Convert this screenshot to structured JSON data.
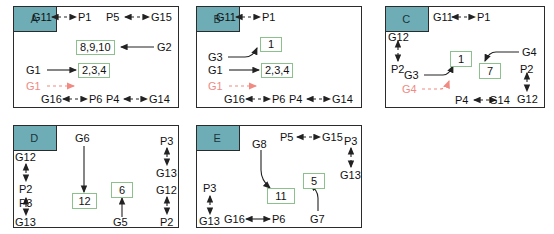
{
  "figure": {
    "title": "",
    "panel_label_color": "#6fadb6",
    "box_border_color": "#8cc08c",
    "red_color": "#f08a82",
    "line_color": "#222222"
  },
  "panels": [
    {
      "id": "A",
      "label": "A",
      "nodes": [
        {
          "name": "G11",
          "text": "G11"
        },
        {
          "name": "P1",
          "text": "P1"
        },
        {
          "name": "P5",
          "text": "P5"
        },
        {
          "name": "G15",
          "text": "G15"
        },
        {
          "name": "G2",
          "text": "G2"
        },
        {
          "name": "G1-solid",
          "text": "G1"
        },
        {
          "name": "G1-red",
          "text": "G1"
        },
        {
          "name": "G16",
          "text": "G16"
        },
        {
          "name": "P6",
          "text": "P6"
        },
        {
          "name": "P4",
          "text": "P4"
        },
        {
          "name": "G14",
          "text": "G14"
        }
      ],
      "boxes": [
        {
          "name": "box-8-9-10",
          "text": "8,9,10"
        },
        {
          "name": "box-2-3-4",
          "text": "2,3,4"
        }
      ]
    },
    {
      "id": "B",
      "label": "B",
      "nodes": [
        {
          "name": "G11",
          "text": "G11"
        },
        {
          "name": "P1",
          "text": "P1"
        },
        {
          "name": "G3",
          "text": "G3"
        },
        {
          "name": "G1-solid",
          "text": "G1"
        },
        {
          "name": "G1-red",
          "text": "G1"
        },
        {
          "name": "G16",
          "text": "G16"
        },
        {
          "name": "P6",
          "text": "P6"
        },
        {
          "name": "P4",
          "text": "P4"
        },
        {
          "name": "G14",
          "text": "G14"
        }
      ],
      "boxes": [
        {
          "name": "box-1",
          "text": "1"
        },
        {
          "name": "box-2-3-4",
          "text": "2,3,4"
        }
      ]
    },
    {
      "id": "C",
      "label": "C",
      "nodes": [
        {
          "name": "G11",
          "text": "G11"
        },
        {
          "name": "P1",
          "text": "P1"
        },
        {
          "name": "G12-left",
          "text": "G12"
        },
        {
          "name": "P2-left",
          "text": "P2"
        },
        {
          "name": "G3",
          "text": "G3"
        },
        {
          "name": "G4-red",
          "text": "G4"
        },
        {
          "name": "G4",
          "text": "G4"
        },
        {
          "name": "P2-right",
          "text": "P2"
        },
        {
          "name": "G12-right",
          "text": "G12"
        },
        {
          "name": "P4",
          "text": "P4"
        },
        {
          "name": "G14",
          "text": "G14"
        }
      ],
      "boxes": [
        {
          "name": "box-1",
          "text": "1"
        },
        {
          "name": "box-7",
          "text": "7"
        }
      ]
    },
    {
      "id": "D",
      "label": "D",
      "nodes": [
        {
          "name": "G6",
          "text": "G6"
        },
        {
          "name": "P3-right",
          "text": "P3"
        },
        {
          "name": "G13-right",
          "text": "G13"
        },
        {
          "name": "G12-right",
          "text": "G12"
        },
        {
          "name": "P2-right",
          "text": "P2"
        },
        {
          "name": "G12-left",
          "text": "G12"
        },
        {
          "name": "P2-left",
          "text": "P2"
        },
        {
          "name": "P3-left",
          "text": "P3"
        },
        {
          "name": "G13-left",
          "text": "G13"
        },
        {
          "name": "G5",
          "text": "G5"
        }
      ],
      "boxes": [
        {
          "name": "box-12",
          "text": "12"
        },
        {
          "name": "box-6",
          "text": "6"
        }
      ]
    },
    {
      "id": "E",
      "label": "E",
      "nodes": [
        {
          "name": "G8",
          "text": "G8"
        },
        {
          "name": "P5",
          "text": "P5"
        },
        {
          "name": "G15",
          "text": "G15"
        },
        {
          "name": "P3-right",
          "text": "P3"
        },
        {
          "name": "G13-right",
          "text": "G13"
        },
        {
          "name": "P3-left",
          "text": "P3"
        },
        {
          "name": "G13-left",
          "text": "G13"
        },
        {
          "name": "G16",
          "text": "G16"
        },
        {
          "name": "P6",
          "text": "P6"
        },
        {
          "name": "G7",
          "text": "G7"
        }
      ],
      "boxes": [
        {
          "name": "box-11",
          "text": "11"
        },
        {
          "name": "box-5",
          "text": "5"
        }
      ]
    }
  ]
}
